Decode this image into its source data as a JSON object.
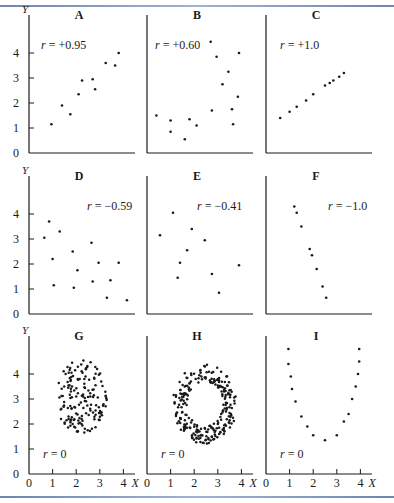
{
  "figure": {
    "axis_label_y": "Y",
    "axis_label_x": "X",
    "y_ticks": [
      "0",
      "1",
      "2",
      "3",
      "4"
    ],
    "x_ticks": [
      "0",
      "1",
      "2",
      "3",
      "4"
    ],
    "colors": {
      "ink": "#1a1a1a",
      "rule": "#7d93ba"
    }
  },
  "chart_data": [
    {
      "type": "scatter",
      "panel": "A",
      "title": "A",
      "annotation": "r = +0.95",
      "r": 0.95,
      "xlim": [
        0,
        4.5
      ],
      "ylim": [
        0,
        4.8
      ],
      "points": [
        [
          0.95,
          1.15
        ],
        [
          1.4,
          1.9
        ],
        [
          1.75,
          1.55
        ],
        [
          2.1,
          2.35
        ],
        [
          2.25,
          2.9
        ],
        [
          2.7,
          2.95
        ],
        [
          2.8,
          2.55
        ],
        [
          3.25,
          3.6
        ],
        [
          3.65,
          3.5
        ],
        [
          3.8,
          4.0
        ]
      ]
    },
    {
      "type": "scatter",
      "panel": "B",
      "title": "B",
      "annotation": "r = +0.60",
      "r": 0.6,
      "xlim": [
        0,
        4.5
      ],
      "ylim": [
        0,
        4.8
      ],
      "points": [
        [
          0.4,
          1.5
        ],
        [
          1.0,
          1.3
        ],
        [
          1.0,
          0.85
        ],
        [
          1.6,
          0.55
        ],
        [
          1.8,
          1.35
        ],
        [
          2.1,
          1.1
        ],
        [
          2.75,
          1.7
        ],
        [
          2.7,
          4.45
        ],
        [
          2.95,
          3.85
        ],
        [
          3.2,
          2.75
        ],
        [
          3.45,
          3.25
        ],
        [
          3.6,
          1.75
        ],
        [
          3.65,
          1.15
        ],
        [
          3.85,
          2.25
        ],
        [
          3.9,
          4.0
        ]
      ]
    },
    {
      "type": "scatter",
      "panel": "C",
      "title": "C",
      "annotation": "r = +1.0",
      "r": 1.0,
      "xlim": [
        0,
        4.5
      ],
      "ylim": [
        0,
        4.8
      ],
      "points": [
        [
          0.6,
          1.4
        ],
        [
          1.0,
          1.65
        ],
        [
          1.3,
          1.85
        ],
        [
          1.7,
          2.1
        ],
        [
          2.0,
          2.35
        ],
        [
          2.5,
          2.7
        ],
        [
          2.7,
          2.8
        ],
        [
          2.85,
          2.9
        ],
        [
          3.1,
          3.05
        ],
        [
          3.3,
          3.2
        ]
      ]
    },
    {
      "type": "scatter",
      "panel": "D",
      "title": "D",
      "annotation": "r = −0.59",
      "r": -0.59,
      "xlim": [
        0,
        4.5
      ],
      "ylim": [
        0,
        4.8
      ],
      "points": [
        [
          0.65,
          3.05
        ],
        [
          0.85,
          3.7
        ],
        [
          1.3,
          3.3
        ],
        [
          1.0,
          2.2
        ],
        [
          1.05,
          1.15
        ],
        [
          1.85,
          2.5
        ],
        [
          2.05,
          1.75
        ],
        [
          1.9,
          1.05
        ],
        [
          2.65,
          2.85
        ],
        [
          2.95,
          2.05
        ],
        [
          2.7,
          1.3
        ],
        [
          3.45,
          1.35
        ],
        [
          3.8,
          2.05
        ],
        [
          3.3,
          0.65
        ],
        [
          4.15,
          0.55
        ]
      ]
    },
    {
      "type": "scatter",
      "panel": "E",
      "title": "E",
      "annotation": "r = −0.41",
      "r": -0.41,
      "xlim": [
        0,
        4.5
      ],
      "ylim": [
        0,
        4.8
      ],
      "points": [
        [
          0.55,
          3.15
        ],
        [
          1.1,
          4.05
        ],
        [
          1.9,
          3.4
        ],
        [
          1.7,
          2.55
        ],
        [
          1.4,
          2.05
        ],
        [
          1.3,
          1.45
        ],
        [
          2.75,
          1.6
        ],
        [
          2.45,
          2.95
        ],
        [
          3.05,
          0.85
        ],
        [
          3.9,
          1.95
        ]
      ]
    },
    {
      "type": "scatter",
      "panel": "F",
      "title": "F",
      "annotation": "r = −1.0",
      "r": -1.0,
      "xlim": [
        0,
        4.5
      ],
      "ylim": [
        0,
        4.8
      ],
      "points": [
        [
          1.2,
          4.3
        ],
        [
          1.3,
          4.05
        ],
        [
          1.5,
          3.5
        ],
        [
          1.85,
          2.6
        ],
        [
          1.95,
          2.35
        ],
        [
          2.15,
          1.8
        ],
        [
          2.4,
          1.1
        ],
        [
          2.55,
          0.65
        ]
      ]
    },
    {
      "type": "scatter",
      "panel": "G",
      "title": "G",
      "annotation": "r = 0",
      "r": 0,
      "xlim": [
        0,
        4.5
      ],
      "ylim": [
        0,
        4.8
      ],
      "description": "dense roughly circular cloud of ~150 points centered near (2.2, 3.1), spanning x 1.0–3.3, y 1.6–4.6",
      "center": [
        2.2,
        3.1
      ],
      "spread": [
        1.1,
        1.5
      ]
    },
    {
      "type": "scatter",
      "panel": "H",
      "title": "H",
      "annotation": "r = 0",
      "r": 0,
      "xlim": [
        0,
        4.5
      ],
      "ylim": [
        0,
        4.8
      ],
      "description": "ring (annulus) of ~250 points centered near (2.45, 2.8), outer radius ~1.6, inner radius ~0.9",
      "center": [
        2.45,
        2.8
      ],
      "outer_radius": 1.6,
      "inner_radius": 0.9
    },
    {
      "type": "scatter",
      "panel": "I",
      "title": "I",
      "annotation": "r = 0",
      "r": 0,
      "xlim": [
        0,
        4.5
      ],
      "ylim": [
        0,
        4.8
      ],
      "points": [
        [
          0.95,
          5.0
        ],
        [
          0.95,
          4.4
        ],
        [
          1.05,
          3.9
        ],
        [
          1.1,
          3.4
        ],
        [
          1.25,
          2.9
        ],
        [
          1.5,
          2.3
        ],
        [
          1.75,
          1.9
        ],
        [
          2.0,
          1.55
        ],
        [
          2.5,
          1.35
        ],
        [
          3.0,
          1.55
        ],
        [
          3.3,
          2.1
        ],
        [
          3.5,
          2.4
        ],
        [
          3.65,
          3.0
        ],
        [
          3.8,
          3.5
        ],
        [
          3.9,
          4.0
        ],
        [
          3.95,
          4.5
        ],
        [
          3.95,
          5.0
        ]
      ]
    }
  ]
}
